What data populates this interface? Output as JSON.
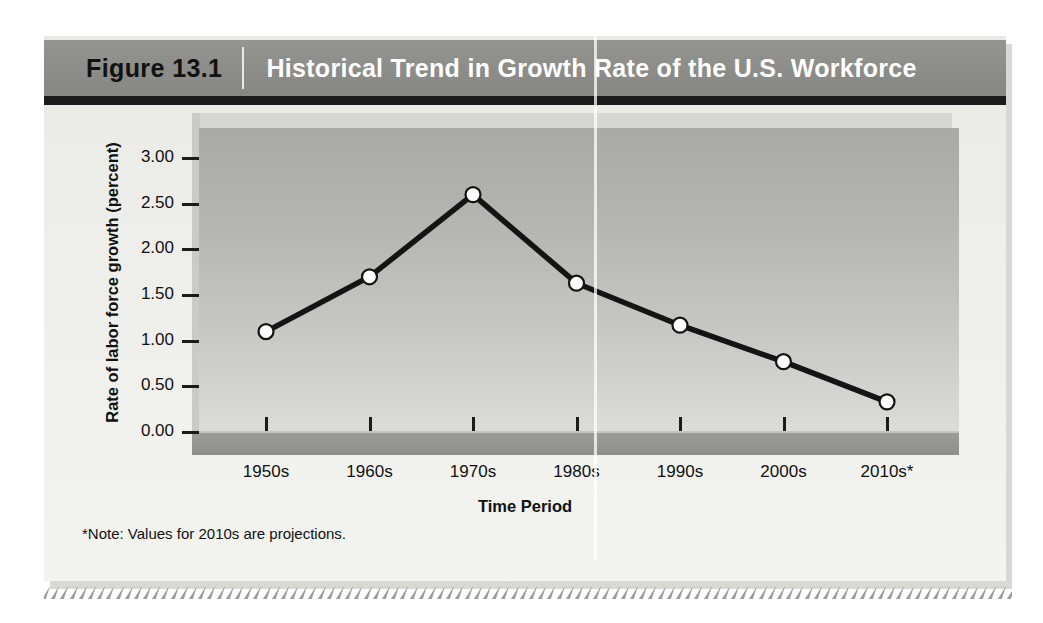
{
  "figure": {
    "label": "Figure 13.1",
    "title": "Historical Trend in Growth Rate of the U.S. Workforce",
    "note": "*Note: Values for 2010s are projections."
  },
  "chart_data": {
    "type": "line",
    "title": "Historical Trend in Growth Rate of the U.S. Workforce",
    "xlabel": "Time Period",
    "ylabel": "Rate of labor force growth (percent)",
    "categories": [
      "1950s",
      "1960s",
      "1970s",
      "1980s",
      "1990s",
      "2000s",
      "2010s*"
    ],
    "values": [
      1.1,
      1.7,
      2.6,
      1.63,
      1.17,
      0.77,
      0.33
    ],
    "ylim": [
      0.0,
      3.25
    ],
    "yticks": [
      "0.00",
      "0.50",
      "1.00",
      "1.50",
      "2.00",
      "2.50",
      "3.00"
    ],
    "ytick_values": [
      0.0,
      0.5,
      1.0,
      1.5,
      2.0,
      2.5,
      3.0
    ],
    "grid": false,
    "legend": "none",
    "marker": "circle-white-black-edge",
    "line_color": "#141414",
    "marker_face": "#ffffff",
    "annotations": [
      "*Note: Values for 2010s are projections."
    ]
  },
  "colors": {
    "title_bar": "#8c8c88",
    "title_text": "#ffffff",
    "figure_label_text": "#111111",
    "panel_bg": "#eeeeeb",
    "plot_wall": "#b4b4b0",
    "plot_floor": "#95958f",
    "line": "#141414",
    "accent_rule": "#1b1b1b"
  }
}
